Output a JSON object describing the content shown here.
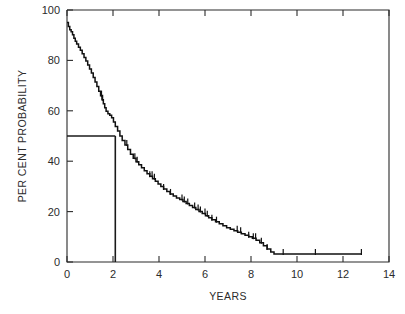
{
  "chart_data": {
    "type": "line",
    "title": "",
    "subtitle": "",
    "xlabel": "YEARS",
    "ylabel": "PER CENT PROBABILITY",
    "xlim": [
      0,
      14
    ],
    "ylim": [
      0,
      100
    ],
    "xticks": [
      0,
      2,
      4,
      6,
      8,
      10,
      12,
      14
    ],
    "xtick_labels": [
      "0",
      "2",
      "4",
      "6",
      "8",
      "10",
      "12",
      "14"
    ],
    "yticks": [
      0,
      20,
      40,
      60,
      80,
      100
    ],
    "ytick_labels": [
      "0",
      "20",
      "40",
      "60",
      "80",
      "100"
    ],
    "grid": false,
    "legend": null,
    "legend_position": "none",
    "series": [
      {
        "name": "Survival probability",
        "style": "kaplan-meier-step",
        "color": "#111111",
        "x": [
          0.0,
          0.06,
          0.12,
          0.18,
          0.24,
          0.3,
          0.36,
          0.42,
          0.5,
          0.58,
          0.66,
          0.74,
          0.82,
          0.9,
          0.98,
          1.06,
          1.14,
          1.22,
          1.3,
          1.38,
          1.46,
          1.52,
          1.58,
          1.64,
          1.7,
          1.78,
          1.86,
          1.94,
          2.02,
          2.1,
          2.2,
          2.3,
          2.4,
          2.52,
          2.64,
          2.76,
          2.88,
          3.0,
          3.12,
          3.24,
          3.36,
          3.48,
          3.6,
          3.72,
          3.84,
          3.96,
          4.08,
          4.2,
          4.34,
          4.48,
          4.62,
          4.76,
          4.9,
          5.04,
          5.18,
          5.32,
          5.46,
          5.6,
          5.74,
          5.88,
          6.02,
          6.16,
          6.3,
          6.46,
          6.62,
          6.78,
          6.94,
          7.1,
          7.26,
          7.42,
          7.58,
          7.74,
          7.9,
          8.06,
          8.22,
          8.38,
          8.54,
          8.7,
          8.86,
          9.0,
          9.4,
          10.0,
          10.8,
          11.6,
          12.2,
          12.8
        ],
        "y": [
          95.0,
          93.5,
          92.2,
          91.4,
          90.2,
          88.8,
          87.6,
          86.5,
          85.2,
          84.0,
          82.6,
          81.2,
          79.8,
          78.2,
          76.6,
          75.0,
          73.2,
          71.4,
          69.6,
          67.8,
          66.0,
          64.4,
          62.8,
          61.2,
          59.8,
          58.8,
          58.2,
          57.2,
          55.6,
          53.8,
          52.0,
          50.0,
          48.2,
          46.4,
          44.6,
          42.8,
          41.2,
          39.8,
          38.6,
          37.4,
          36.2,
          35.0,
          34.0,
          33.0,
          32.0,
          31.0,
          30.0,
          29.0,
          28.0,
          27.0,
          26.2,
          25.4,
          24.8,
          24.0,
          23.2,
          22.4,
          21.6,
          20.8,
          20.0,
          19.2,
          18.4,
          17.6,
          16.8,
          16.0,
          15.2,
          14.4,
          13.6,
          13.0,
          12.4,
          11.8,
          11.2,
          10.6,
          10.0,
          9.4,
          8.6,
          7.6,
          6.4,
          5.2,
          4.0,
          3.2,
          3.2,
          3.2,
          3.2,
          3.2,
          3.2,
          3.2
        ]
      }
    ],
    "censor_marks_x": [
      1.5,
      1.55,
      2.6,
      2.95,
      3.05,
      3.6,
      3.7,
      3.8,
      4.2,
      4.5,
      5.0,
      5.1,
      5.25,
      5.55,
      5.7,
      5.8,
      6.0,
      6.1,
      6.3,
      6.5,
      7.4,
      7.55,
      7.9,
      8.1,
      8.2,
      8.45,
      8.7,
      9.4,
      10.8,
      12.8
    ],
    "annotations": [
      {
        "type": "reference-line",
        "name": "median-survival-horizontal",
        "orientation": "horizontal",
        "y": 50,
        "x_from": 0,
        "x_to": 2.1
      },
      {
        "type": "reference-line",
        "name": "median-survival-vertical",
        "orientation": "vertical",
        "x": 2.1,
        "y_from": 0,
        "y_to": 50
      }
    ],
    "median_survival_years": 2.1,
    "median_survival_percent": 50
  },
  "figure": {
    "background_color": "#ffffff",
    "axis_color": "#2b2b2b",
    "curve_color": "#111111"
  }
}
